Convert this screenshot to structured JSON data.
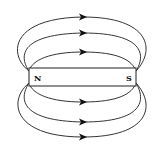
{
  "diagram": {
    "magnet": {
      "north_label": "N",
      "south_label": "S"
    },
    "field_lines": {
      "count_above": 3,
      "count_below": 3,
      "arrow_direction": "N to S (left to right)"
    },
    "colors": {
      "line": "#333333",
      "arrow": "#111111",
      "background": "#ffffff"
    }
  }
}
